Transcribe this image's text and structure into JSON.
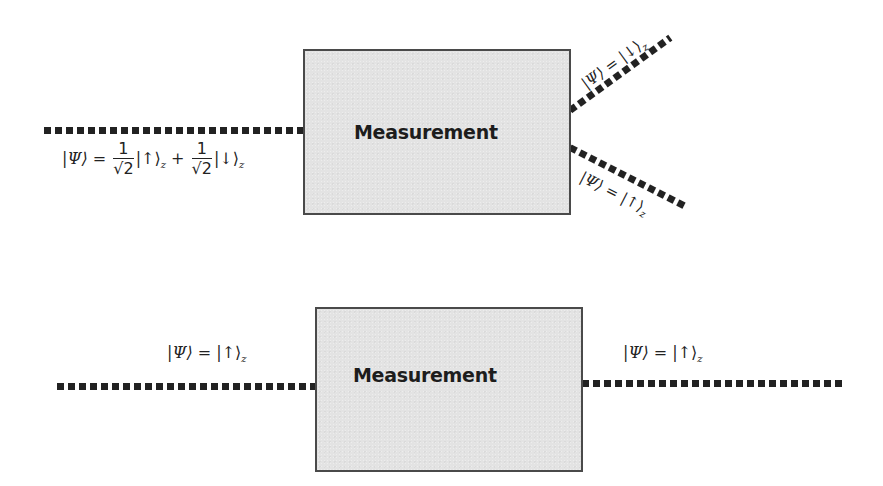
{
  "diagram": {
    "top": {
      "box_label": "Measurement",
      "input_state": {
        "lhs": "|Ψ⟩ = ",
        "coef1_num": "1",
        "coef1_den": "√2",
        "ket1": "|↑⟩",
        "ket1_sub": "z",
        "plus": " + ",
        "coef2_num": "1",
        "coef2_den": "√2",
        "ket2": "|↓⟩",
        "ket2_sub": "z"
      },
      "output_up_branch": {
        "lhs": "|Ψ⟩ = ",
        "ket": "|↓⟩",
        "sub": "z"
      },
      "output_down_branch": {
        "lhs": "|Ψ⟩ = ",
        "ket": "|↑⟩",
        "sub": "z"
      }
    },
    "bottom": {
      "box_label": "Measurement",
      "input_state": {
        "lhs": "|Ψ⟩ = ",
        "ket": "|↑⟩",
        "sub": "z"
      },
      "output_state": {
        "lhs": "|Ψ⟩ = ",
        "ket": "|↑⟩",
        "sub": "z"
      }
    },
    "colors": {
      "box_fill": "#e3e3e3",
      "box_border": "#4a4a4a",
      "beam_dots": "#222222",
      "text": "#222222"
    }
  }
}
